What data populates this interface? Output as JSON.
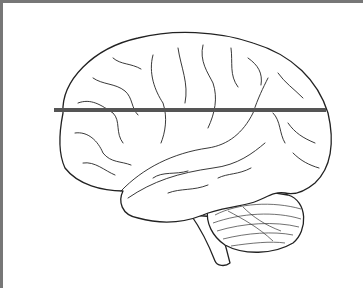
{
  "figure": {
    "cut_line": {
      "orientation": "horizontal",
      "y": 107,
      "x_start": 51,
      "x_end": 323,
      "color": "#555555"
    },
    "frame": {
      "border_color": "#777777",
      "sides": [
        "left",
        "top"
      ]
    }
  }
}
